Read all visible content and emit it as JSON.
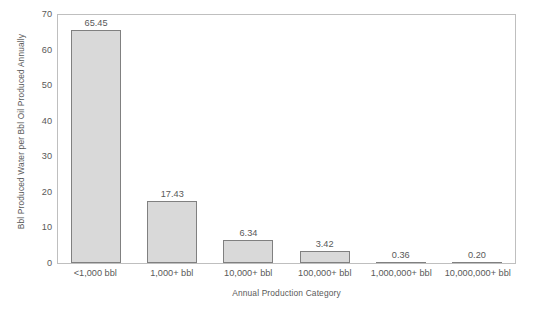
{
  "chart_data": {
    "type": "bar",
    "title": "",
    "categories": [
      "<1,000 bbl",
      "1,000+ bbl",
      "10,000+ bbl",
      "100,000+ bbl",
      "1,000,000+ bbl",
      "10,000,000+ bbl"
    ],
    "values": [
      65.45,
      17.43,
      6.34,
      3.42,
      0.36,
      0.2
    ],
    "value_labels": [
      "65.45",
      "17.43",
      "6.34",
      "3.42",
      "0.36",
      "0.20"
    ],
    "xlabel": "Annual Production Category",
    "ylabel": "Bbl Produced Water per Bbl Oil Produced Annually",
    "ylim": [
      0,
      70
    ],
    "ytick_step": 10,
    "yticks": [
      70,
      60,
      50,
      40,
      30,
      20,
      10,
      0
    ],
    "ytick_labels": [
      "70",
      "60",
      "50",
      "40",
      "30",
      "20",
      "10",
      "0"
    ],
    "grid": false,
    "legend": false,
    "legend_position": "none",
    "bar_fill_color": "#d9d9d9",
    "bar_border_color": "#808080",
    "axis_color": "#bfbfbf",
    "text_color": "#595959"
  }
}
